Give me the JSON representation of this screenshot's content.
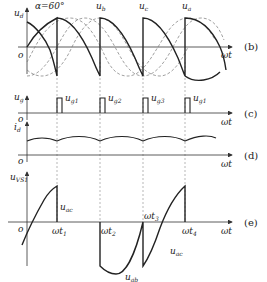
{
  "panels": {
    "b": {
      "label": "(b)",
      "y_label": "u",
      "y_label_sub": "d",
      "x_label": "ωt",
      "origin": "o",
      "alpha_label": "α=60°",
      "phase_labels": [
        "u",
        "u",
        "u"
      ],
      "phase_subs": [
        "b",
        "c",
        "a"
      ]
    },
    "c": {
      "label": "(c)",
      "y_label": "u",
      "y_label_sub": "g",
      "x_label": "ωt",
      "origin": "o",
      "pulse_labels": [
        "u",
        "u",
        "u",
        "u"
      ],
      "pulse_subs": [
        "g1",
        "g2",
        "g3",
        "g1"
      ]
    },
    "d": {
      "label": "(d)",
      "y_label": "i",
      "y_label_sub": "d",
      "x_label": "ωt",
      "origin": "o"
    },
    "e": {
      "label": "(e)",
      "y_label": "u",
      "y_label_sub": "VS1",
      "x_label": "ωt",
      "origin": "o",
      "time_marks": [
        "ωt",
        "ωt",
        "ωt",
        "ωt"
      ],
      "time_subs": [
        "1",
        "2",
        "3",
        "4"
      ],
      "segment_labels": [
        {
          "text": "u",
          "sub": "ac"
        },
        {
          "text": "u",
          "sub": "ab"
        },
        {
          "text": "u",
          "sub": "ac"
        }
      ]
    }
  }
}
